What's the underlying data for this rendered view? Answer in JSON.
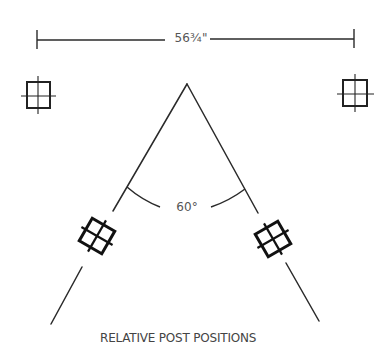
{
  "dimension": {
    "label": "56¾\""
  },
  "angle": {
    "label": "60°"
  },
  "caption": "RELATIVE POST POSITIONS",
  "colors": {
    "line": "#2a2a2a",
    "text": "#555555",
    "background": "#ffffff"
  },
  "posts": [
    {
      "name": "left-top-post",
      "x": 38,
      "y": 95,
      "rotation": 0
    },
    {
      "name": "right-top-post",
      "x": 355,
      "y": 93,
      "rotation": 0
    },
    {
      "name": "left-angled-post",
      "x": 97,
      "y": 236,
      "rotation": 30
    },
    {
      "name": "right-angled-post",
      "x": 273,
      "y": 239,
      "rotation": -30
    }
  ]
}
